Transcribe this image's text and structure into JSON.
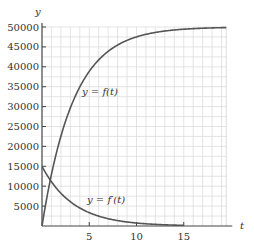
{
  "chart_data": {
    "type": "line",
    "title": "",
    "xlabel": "t",
    "ylabel": "y",
    "xlim": [
      0,
      19.5
    ],
    "ylim": [
      0,
      50000
    ],
    "grid": true,
    "x_ticks": [
      5,
      10,
      15
    ],
    "x_tick_labels": [
      "5",
      "10",
      "15"
    ],
    "y_ticks": [
      5000,
      10000,
      15000,
      20000,
      25000,
      30000,
      35000,
      40000,
      45000,
      50000
    ],
    "y_tick_labels": [
      "5000",
      "10000",
      "15000",
      "20000",
      "25000",
      "30000",
      "35000",
      "40000",
      "45000",
      "50000"
    ],
    "series": [
      {
        "name": "y = f(t)",
        "x": [
          0,
          1,
          2,
          3,
          4,
          5,
          6,
          7,
          8,
          9,
          10,
          12,
          14,
          16,
          18,
          19.5
        ],
        "values": [
          0,
          12959,
          22559,
          29671,
          34940,
          38843,
          41735,
          43877,
          45465,
          46640,
          47511,
          48634,
          49250,
          49588,
          49774,
          49846
        ]
      },
      {
        "name": "y = f'(t)",
        "x": [
          0,
          1,
          2,
          3,
          4,
          5,
          6,
          7,
          8,
          9,
          10,
          12,
          14,
          15
        ],
        "values": [
          15000,
          11112,
          8232,
          6099,
          4518,
          3347,
          2479,
          1837,
          1361,
          1008,
          747,
          410,
          225,
          167
        ]
      }
    ],
    "annotations": [
      {
        "text": "y = f(t)",
        "x": 4.5,
        "y": 32000
      },
      {
        "text": "y = f'(t)",
        "x": 5,
        "y": 5500
      }
    ]
  },
  "labels": {
    "y_axis": "y",
    "x_axis": "t",
    "f_label": "y = f(t)",
    "fp_label": "y = f′(t)"
  }
}
